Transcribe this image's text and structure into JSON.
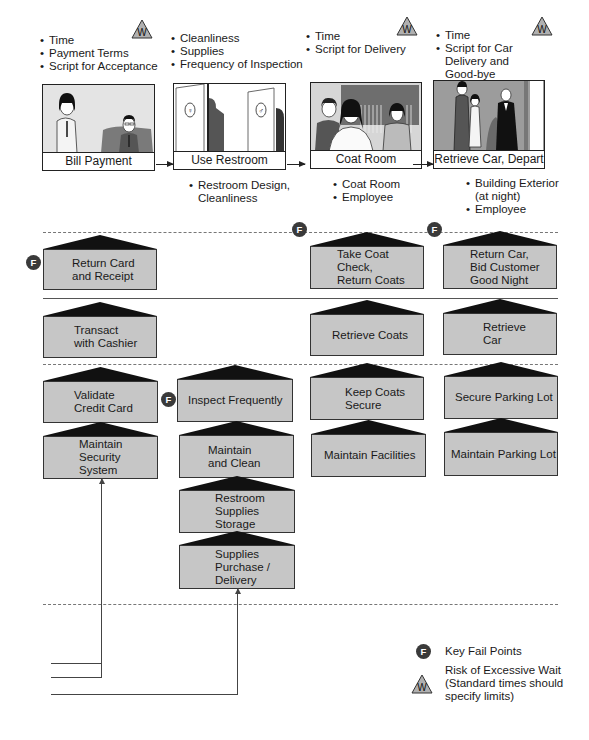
{
  "steps": [
    {
      "label": "Bill Payment",
      "standards": [
        "Time",
        "Payment Terms",
        "Script for Acceptance"
      ],
      "has_wait_risk": true,
      "physical_evidence": []
    },
    {
      "label": "Use Restroom",
      "standards": [
        "Cleanliness",
        "Supplies",
        "Frequency of Inspection"
      ],
      "has_wait_risk": false,
      "physical_evidence": [
        "Restroom Design,",
        "Cleanliness"
      ]
    },
    {
      "label": "Coat Room",
      "standards": [
        "Time",
        "Script for Delivery"
      ],
      "has_wait_risk": true,
      "physical_evidence": [
        "Coat Room",
        "Employee"
      ]
    },
    {
      "label": "Retrieve Car, Depart",
      "standards": [
        "Time",
        "Script for Car",
        "Delivery and",
        "Good-bye"
      ],
      "has_wait_risk": true,
      "physical_evidence": [
        "Building Exterior",
        "(at night)",
        "Employee"
      ]
    }
  ],
  "onstage": [
    {
      "text": "Return Card\nand Receipt",
      "fail_point": true
    },
    {
      "text": "Take Coat\nCheck,\nReturn Coats",
      "fail_point": true
    },
    {
      "text": "Return Car,\nBid Customer\nGood Night",
      "fail_point": true
    }
  ],
  "backstage": [
    {
      "text": "Transact\nwith Cashier"
    },
    {
      "text": "Retrieve Coats"
    },
    {
      "text": "Retrieve\nCar"
    }
  ],
  "support_row1": [
    {
      "text": "Validate\nCredit Card"
    },
    {
      "text": "Inspect Frequently",
      "fail_point": true
    },
    {
      "text": "Keep Coats\nSecure"
    },
    {
      "text": "Secure Parking Lot"
    }
  ],
  "support_row2": [
    {
      "text": "Maintain\nSecurity\nSystem"
    },
    {
      "text": "Maintain\nand Clean"
    },
    {
      "text": "Maintain Facilities"
    },
    {
      "text": "Maintain Parking Lot"
    }
  ],
  "support_chain": [
    {
      "text": "Restroom\nSupplies\nStorage"
    },
    {
      "text": "Supplies\nPurchase /\nDelivery"
    }
  ],
  "icons": {
    "fail_point_glyph": "F",
    "wait_glyph": "W"
  },
  "legend": {
    "fail_point_label": "Key Fail Points",
    "wait_label_lines": [
      "Risk of Excessive Wait",
      "(Standard times should",
      "specify limits)"
    ]
  },
  "colors": {
    "node_fill": "#c6c6c6",
    "roof_fill": "#111111",
    "fail_badge": "#3a3a3a",
    "wait_triangle": "#b0b0b0"
  }
}
